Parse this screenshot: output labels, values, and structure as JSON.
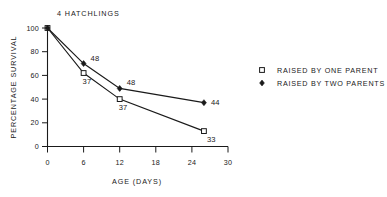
{
  "chart_data": {
    "type": "line",
    "title": "4  HATCHLINGS",
    "xlabel": "AGE  (DAYS)",
    "ylabel": "PERCENTAGE  SURVIVAL",
    "xlim": [
      0,
      30
    ],
    "ylim": [
      0,
      100
    ],
    "xticks": [
      "0",
      "6",
      "12",
      "18",
      "24",
      "30"
    ],
    "xtick_values": [
      0,
      6,
      12,
      18,
      24,
      30
    ],
    "yticks": [
      "0",
      "20",
      "40",
      "60",
      "80",
      "100"
    ],
    "ytick_values": [
      0,
      20,
      40,
      60,
      80,
      100
    ],
    "grid": false,
    "legend_position": "right",
    "series": [
      {
        "name": "RAISED BY ONE PARENT",
        "marker": "open-square",
        "x": [
          0,
          6,
          12,
          26
        ],
        "values": [
          100,
          62,
          40,
          13
        ],
        "point_labels": [
          "",
          "37",
          "37",
          "33"
        ]
      },
      {
        "name": "RAISED BY TWO PARENTS",
        "marker": "filled-diamond",
        "x": [
          0,
          6,
          12,
          26
        ],
        "values": [
          100,
          70,
          49,
          37
        ],
        "point_labels": [
          "",
          "48",
          "48",
          "44"
        ]
      }
    ],
    "annotations": [
      {
        "text": "48",
        "x": 6,
        "y": 70,
        "dx": 7,
        "dy": -3
      },
      {
        "text": "37",
        "x": 6,
        "y": 62,
        "dx": -1,
        "dy": 11
      },
      {
        "text": "48",
        "x": 12,
        "y": 49,
        "dx": 7,
        "dy": -3
      },
      {
        "text": "37",
        "x": 12,
        "y": 40,
        "dx": -1,
        "dy": 11
      },
      {
        "text": "44",
        "x": 26,
        "y": 37,
        "dx": 7,
        "dy": 2
      },
      {
        "text": "33",
        "x": 26,
        "y": 13,
        "dx": 3,
        "dy": 11
      }
    ]
  },
  "legend": {
    "items": [
      {
        "label": "RAISED BY ONE PARENT",
        "marker": "open-square"
      },
      {
        "label": "RAISED BY TWO PARENTS",
        "marker": "filled-diamond"
      }
    ]
  },
  "colors": {
    "ink": "#1a1a1a",
    "background": "#ffffff"
  }
}
